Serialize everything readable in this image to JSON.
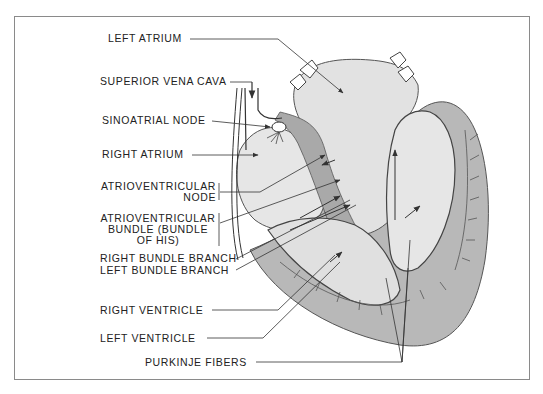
{
  "diagram": {
    "labels": {
      "left_atrium": "LEFT ATRIUM",
      "superior_vena_cava": "SUPERIOR VENA CAVA",
      "sinoatrial_node": "SINOATRIAL NODE",
      "right_atrium": "RIGHT ATRIUM",
      "av_node_1": "ATRIOVENTRICULAR",
      "av_node_2": "NODE",
      "av_bundle_1": "ATRIOVENTRICULAR",
      "av_bundle_2": "BUNDLE (BUNDLE",
      "av_bundle_3": "OF HIS)",
      "right_bundle_branch": "RIGHT BUNDLE BRANCH",
      "left_bundle_branch": "LEFT BUNDLE BRANCH",
      "right_ventricle": "RIGHT VENTRICLE",
      "left_ventricle": "LEFT VENTRICLE",
      "purkinje_fibers": "PURKINJE FIBERS"
    },
    "colors": {
      "frame": "#8a8a8a",
      "chamber_light": "#e4e4e4",
      "myocardium_dark": "#b5b5b5",
      "line": "#333333",
      "fibers": "#555555"
    }
  }
}
